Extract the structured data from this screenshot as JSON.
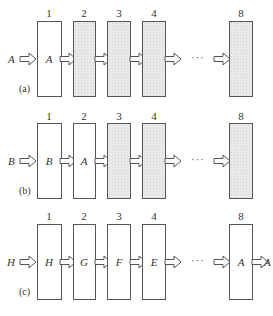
{
  "diagram": {
    "ellipsis": "···",
    "rows": [
      {
        "id": "a",
        "label": "(a)",
        "input": "A",
        "output": "",
        "stages": [
          {
            "index": "1",
            "content": "A",
            "filled": false
          },
          {
            "index": "2",
            "content": "",
            "filled": true
          },
          {
            "index": "3",
            "content": "",
            "filled": true
          },
          {
            "index": "4",
            "content": "",
            "filled": true
          },
          {
            "index": "8",
            "content": "",
            "filled": true
          }
        ]
      },
      {
        "id": "b",
        "label": "(b)",
        "input": "B",
        "output": "",
        "stages": [
          {
            "index": "1",
            "content": "B",
            "filled": false
          },
          {
            "index": "2",
            "content": "A",
            "filled": false
          },
          {
            "index": "3",
            "content": "",
            "filled": true
          },
          {
            "index": "4",
            "content": "",
            "filled": true
          },
          {
            "index": "8",
            "content": "",
            "filled": true
          }
        ]
      },
      {
        "id": "c",
        "label": "(c)",
        "input": "H",
        "output": "A",
        "stages": [
          {
            "index": "1",
            "content": "H",
            "filled": false
          },
          {
            "index": "2",
            "content": "G",
            "filled": false
          },
          {
            "index": "3",
            "content": "F",
            "filled": false
          },
          {
            "index": "4",
            "content": "E",
            "filled": false
          },
          {
            "index": "8",
            "content": "A",
            "filled": false
          }
        ]
      }
    ]
  }
}
